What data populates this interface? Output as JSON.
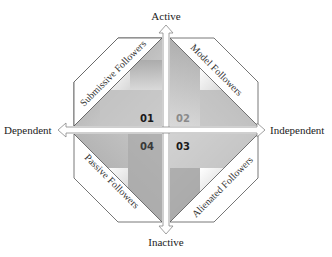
{
  "axes": {
    "top": "Active",
    "bottom": "Inactive",
    "left": "Dependent",
    "right": "Independent"
  },
  "quadrants": [
    {
      "id": "01",
      "label": "Submissive Followers",
      "position": "top-left",
      "number_color": "#1a1a1a"
    },
    {
      "id": "02",
      "label": "Model Followers",
      "position": "top-right",
      "number_color": "#8a8a8a"
    },
    {
      "id": "03",
      "label": "Alienated Followers",
      "position": "bottom-right",
      "number_color": "#1a1a1a"
    },
    {
      "id": "04",
      "label": "Passive Followers",
      "position": "bottom-left",
      "number_color": "#3a3a3a"
    }
  ],
  "colors": {
    "outline": "#555555",
    "band_fill": "#ffffff",
    "arrow_fill": "#ffffff",
    "arrow_stroke": "#888888"
  }
}
